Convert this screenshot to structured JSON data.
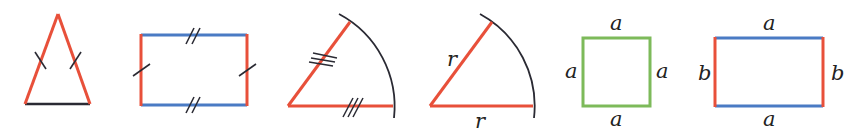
{
  "colors": {
    "red": "#e8503a",
    "blue": "#4a7bc4",
    "green": "#7dba5a",
    "black": "#2a2a33"
  },
  "figures": [
    {
      "id": "isosceles-triangle",
      "description": "Isosceles triangle with two equal red legs (single tick marks) and black base",
      "labels": []
    },
    {
      "id": "parallelogram-rectangle",
      "description": "Rectangle with blue top/bottom sides (double ticks) and red left/right sides (single ticks)",
      "labels": []
    },
    {
      "id": "sector-triple-tick",
      "description": "Circular sector with two red radii marked with triple ticks and black arc",
      "labels": []
    },
    {
      "id": "sector-radius",
      "description": "Circular sector with two red radii labelled r and black arc",
      "labels": [
        "r",
        "r"
      ]
    },
    {
      "id": "square",
      "description": "Green square with all sides labelled a",
      "labels": [
        "a",
        "a",
        "a",
        "a"
      ]
    },
    {
      "id": "rectangle",
      "description": "Rectangle with blue sides labelled a and red sides labelled b",
      "labels": [
        "a",
        "b",
        "b",
        "a"
      ]
    }
  ],
  "labels": {
    "sector_r_left": "r",
    "sector_r_bottom": "r",
    "square_top": "a",
    "square_left": "a",
    "square_right": "a",
    "square_bottom": "a",
    "rect_top": "a",
    "rect_left": "b",
    "rect_right": "b",
    "rect_bottom": "a"
  }
}
